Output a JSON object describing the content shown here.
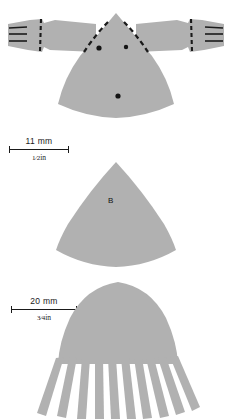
{
  "page": {
    "background_color": "#ffffff",
    "artifact_fill": "#b1b1b1",
    "ink_color": "#1a1a1a",
    "width": 232,
    "height": 419
  },
  "figures": [
    {
      "id": "figure-a-top",
      "name": "winged-fan-pattern",
      "description": "Fan/sector body with two horizontal wing arms ending in slit tips",
      "markings": {
        "tip_slits_left": 3,
        "tip_slits_right": 3,
        "dashed_seam_lines": 4,
        "dots": 3
      },
      "label": ""
    },
    {
      "id": "figure-b-middle",
      "name": "plain-fan-pattern",
      "description": "Plain circular sector / fan shape",
      "label": "B"
    },
    {
      "id": "figure-c-bottom",
      "name": "fringed-dome-pattern",
      "description": "Parabolic dome shape with cut fringe strips along the lower edge",
      "fringe_strips": 11,
      "label": ""
    }
  ],
  "scale_bars": [
    {
      "id": "scale-bar-upper",
      "metric": "11  mm",
      "imperial_fraction": "1⁄2",
      "imperial_unit": "in"
    },
    {
      "id": "scale-bar-lower",
      "metric": "20  mm",
      "imperial_fraction": "3⁄4",
      "imperial_unit": "in"
    }
  ]
}
